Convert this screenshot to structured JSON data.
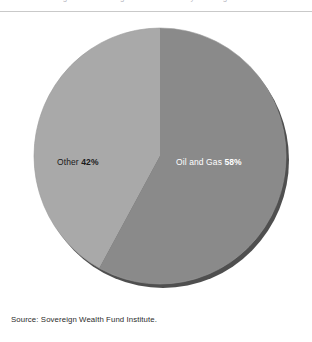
{
  "figure": {
    "clipped_header_text": "Figure 3. Sovereign Wealth Funds by Funding Source",
    "source_note": "Source: Sovereign Wealth Fund Institute."
  },
  "colors": {
    "slice_oil_and_gas": "#8a8a8a",
    "slice_other": "#a9a9a9",
    "shadow_rim": "#4f4f4f",
    "outline": "#7a7a7a",
    "background": "#ffffff",
    "rule": "#c9c9c9",
    "label_dark": "#1a1a1a",
    "label_light": "#ffffff"
  },
  "labels": {
    "other": {
      "name": "Other",
      "value": "42%"
    },
    "oil_and_gas": {
      "name": "Oil and Gas",
      "value": "58%"
    }
  },
  "chart_data": {
    "type": "pie",
    "title": "",
    "xlabel": "",
    "ylabel": "",
    "legend_position": "none",
    "grid": false,
    "start_angle_deg": 0,
    "direction": "clockwise",
    "categories": [
      "Oil and Gas",
      "Other"
    ],
    "values": [
      58,
      42
    ],
    "units": "percent",
    "slices": [
      {
        "label": "Oil and Gas",
        "value": 58,
        "display_value": "58%",
        "color": "#8a8a8a",
        "label_text_color": "#ffffff",
        "sweep_deg": 208.8
      },
      {
        "label": "Other",
        "value": 42,
        "display_value": "42%",
        "color": "#a9a9a9",
        "label_text_color": "#1a1a1a",
        "sweep_deg": 151.2
      }
    ],
    "annotations": [
      "Other 42%",
      "Oil and Gas 58%"
    ],
    "source": "Source: Sovereign Wealth Fund Institute."
  }
}
